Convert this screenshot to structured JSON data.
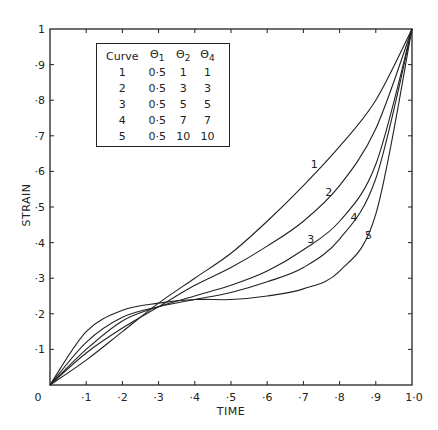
{
  "chart_data": {
    "type": "line",
    "title": "",
    "xlabel": "TIME",
    "ylabel": "STRAIN",
    "xlim": [
      0,
      1
    ],
    "ylim": [
      0,
      1
    ],
    "grid": false,
    "x_ticks": [
      "0",
      "·1",
      "·2",
      "·3",
      "·4",
      "·5",
      "·6",
      "·7",
      "·8",
      "·9",
      "1·0"
    ],
    "y_ticks": [
      "0",
      "·1",
      "·2",
      "·3",
      "·4",
      "·5",
      "·6",
      "·7",
      "·8",
      "·9",
      "1"
    ],
    "x": [
      0,
      0.1,
      0.2,
      0.3,
      0.4,
      0.5,
      0.6,
      0.7,
      0.8,
      0.9,
      1.0
    ],
    "series": [
      {
        "name": "1",
        "values": [
          0,
          0.07,
          0.15,
          0.23,
          0.3,
          0.37,
          0.46,
          0.56,
          0.67,
          0.8,
          1.0
        ]
      },
      {
        "name": "2",
        "values": [
          0,
          0.09,
          0.16,
          0.22,
          0.28,
          0.33,
          0.39,
          0.46,
          0.56,
          0.72,
          1.0
        ]
      },
      {
        "name": "3",
        "values": [
          0,
          0.1,
          0.18,
          0.22,
          0.25,
          0.28,
          0.32,
          0.38,
          0.46,
          0.62,
          1.0
        ]
      },
      {
        "name": "4",
        "values": [
          0,
          0.12,
          0.19,
          0.22,
          0.24,
          0.26,
          0.29,
          0.33,
          0.41,
          0.58,
          1.0
        ]
      },
      {
        "name": "5",
        "values": [
          0,
          0.15,
          0.21,
          0.23,
          0.24,
          0.24,
          0.25,
          0.27,
          0.32,
          0.48,
          1.0
        ]
      }
    ],
    "legend": {
      "position": "upper left (inset table)",
      "headers": [
        "Curve",
        "Θ1",
        "Θ2",
        "Θ4"
      ],
      "rows": [
        [
          "1",
          "0·5",
          "1",
          "1"
        ],
        [
          "2",
          "0·5",
          "3",
          "3"
        ],
        [
          "3",
          "0·5",
          "5",
          "5"
        ],
        [
          "4",
          "0·5",
          "7",
          "7"
        ],
        [
          "5",
          "0·5",
          "10",
          "10"
        ]
      ]
    },
    "annotations": [
      {
        "text": "1",
        "x": 0.73,
        "y": 0.61
      },
      {
        "text": "2",
        "x": 0.77,
        "y": 0.53
      },
      {
        "text": "3",
        "x": 0.72,
        "y": 0.4
      },
      {
        "text": "4",
        "x": 0.84,
        "y": 0.46
      },
      {
        "text": "5",
        "x": 0.88,
        "y": 0.41
      }
    ]
  },
  "legend_table": {
    "header": {
      "curve": "Curve",
      "t1": "Θ",
      "t1_sub": "1",
      "t2": "Θ",
      "t2_sub": "2",
      "t4": "Θ",
      "t4_sub": "4"
    },
    "rows": [
      {
        "curve": "1",
        "t1": "0·5",
        "t2": "1",
        "t4": "1"
      },
      {
        "curve": "2",
        "t1": "0·5",
        "t2": "3",
        "t4": "3"
      },
      {
        "curve": "3",
        "t1": "0·5",
        "t2": "5",
        "t4": "5"
      },
      {
        "curve": "4",
        "t1": "0·5",
        "t2": "7",
        "t4": "7"
      },
      {
        "curve": "5",
        "t1": "0·5",
        "t2": "10",
        "t4": "10"
      }
    ]
  }
}
